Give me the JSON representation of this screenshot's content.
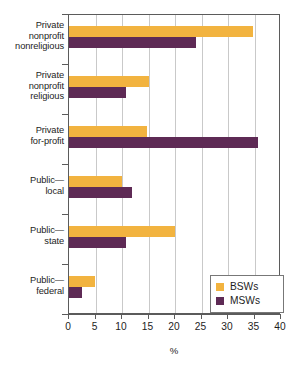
{
  "chart_data": {
    "type": "bar",
    "orientation": "horizontal",
    "title": "",
    "xlabel": "%",
    "ylabel": "",
    "xlim": [
      0,
      40
    ],
    "xticks": [
      0,
      5,
      10,
      15,
      20,
      25,
      30,
      35,
      40
    ],
    "xtick_labels": [
      "0",
      "5",
      "10",
      "15",
      "20",
      "25",
      "30",
      "35",
      "40"
    ],
    "grid": "vertical",
    "legend_position": "bottom-right",
    "categories": [
      "Private nonprofit nonreligious",
      "Private nonprofit religious",
      "Private for-profit",
      "Public—local",
      "Public—state",
      "Public—federal"
    ],
    "category_label_lines": [
      [
        "Private",
        "nonprofit",
        "nonreligious"
      ],
      [
        "Private",
        "nonprofit",
        "religious"
      ],
      [
        "Private",
        "for-profit"
      ],
      [
        "Public—",
        "local"
      ],
      [
        "Public—",
        "state"
      ],
      [
        "Public—",
        "federal"
      ]
    ],
    "series": [
      {
        "name": "BSWs",
        "color": "#f2b33f",
        "values": [
          34.8,
          15.0,
          14.7,
          10.0,
          20.0,
          4.9
        ]
      },
      {
        "name": "MSWs",
        "color": "#5e2a55",
        "values": [
          24.0,
          10.7,
          35.7,
          11.8,
          10.7,
          2.4
        ]
      }
    ]
  },
  "legend": {
    "entries": [
      {
        "label": "BSWs",
        "color": "#f2b33f"
      },
      {
        "label": "MSWs",
        "color": "#5e2a55"
      }
    ]
  },
  "axis": {
    "x_title": "%"
  },
  "colors": {
    "bsw": "#f2b33f",
    "msw": "#5e2a55",
    "axis": "#5b5b5b",
    "grid": "#c9c9c9",
    "text": "#1d1d1d"
  }
}
